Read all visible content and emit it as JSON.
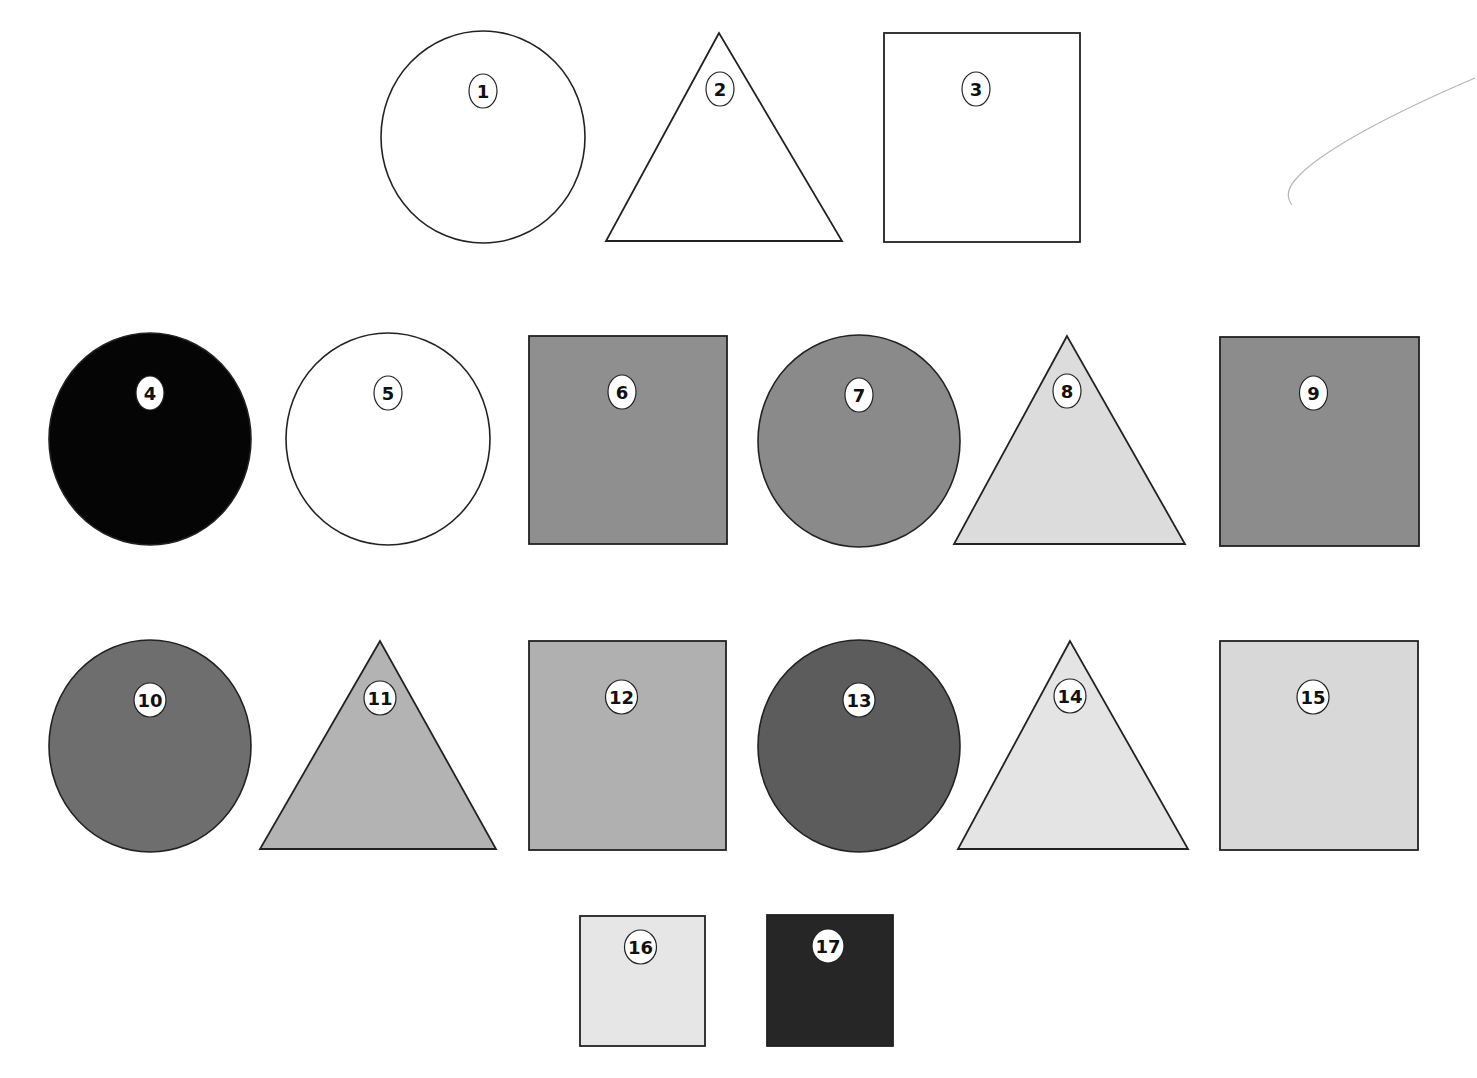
{
  "figure": {
    "shapes": [
      {
        "id": "1",
        "label": "1",
        "type": "circle",
        "fill": "#ffffff",
        "cx": 483,
        "cy": 137,
        "rx": 102,
        "ry": 106
      },
      {
        "id": "2",
        "label": "2",
        "type": "triangle",
        "fill": "#ffffff",
        "points": "719,33 606,241 842,241",
        "lx": 720,
        "ly": 89
      },
      {
        "id": "3",
        "label": "3",
        "type": "square",
        "fill": "#ffffff",
        "x": 884,
        "y": 33,
        "w": 196,
        "h": 209
      },
      {
        "id": "4",
        "label": "4",
        "type": "circle",
        "fill": "#050505",
        "cx": 150,
        "cy": 439,
        "rx": 101,
        "ry": 106
      },
      {
        "id": "5",
        "label": "5",
        "type": "circle",
        "fill": "#ffffff",
        "cx": 388,
        "cy": 439,
        "rx": 102,
        "ry": 106
      },
      {
        "id": "6",
        "label": "6",
        "type": "square",
        "fill": "#8f8f8f",
        "x": 529,
        "y": 336,
        "w": 198,
        "h": 208
      },
      {
        "id": "7",
        "label": "7",
        "type": "circle",
        "fill": "#8a8a8a",
        "cx": 859,
        "cy": 441,
        "rx": 101,
        "ry": 106
      },
      {
        "id": "8",
        "label": "8",
        "type": "triangle",
        "fill": "#dcdcdc",
        "points": "1067,336 954,544 1185,544",
        "lx": 1067,
        "ly": 391
      },
      {
        "id": "9",
        "label": "9",
        "type": "square",
        "fill": "#8c8c8c",
        "x": 1220,
        "y": 337,
        "w": 199,
        "h": 209
      },
      {
        "id": "10",
        "label": "10",
        "type": "circle",
        "fill": "#6e6e6e",
        "cx": 150,
        "cy": 746,
        "rx": 101,
        "ry": 106
      },
      {
        "id": "11",
        "label": "11",
        "type": "triangle",
        "fill": "#b3b3b3",
        "points": "380,641 260,849 496,849",
        "lx": 380,
        "ly": 698
      },
      {
        "id": "12",
        "label": "12",
        "type": "square",
        "fill": "#b0b0b0",
        "x": 529,
        "y": 641,
        "w": 197,
        "h": 209
      },
      {
        "id": "13",
        "label": "13",
        "type": "circle",
        "fill": "#5c5c5c",
        "cx": 859,
        "cy": 746,
        "rx": 101,
        "ry": 106
      },
      {
        "id": "14",
        "label": "14",
        "type": "triangle",
        "fill": "#e4e4e4",
        "points": "1070,641 958,849 1188,849",
        "lx": 1070,
        "ly": 696
      },
      {
        "id": "15",
        "label": "15",
        "type": "square",
        "fill": "#d8d8d8",
        "x": 1220,
        "y": 641,
        "w": 198,
        "h": 209
      },
      {
        "id": "16",
        "label": "16",
        "type": "square",
        "fill": "#e6e6e6",
        "x": 580,
        "y": 916,
        "w": 125,
        "h": 130
      },
      {
        "id": "17",
        "label": "17",
        "type": "square",
        "fill": "#262626",
        "x": 767,
        "y": 915,
        "w": 126,
        "h": 131
      }
    ]
  }
}
